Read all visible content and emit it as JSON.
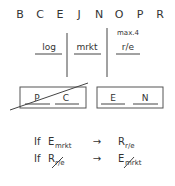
{
  "letters": [
    "B",
    "C",
    "E",
    "J",
    "N",
    "O",
    "P",
    "R"
  ],
  "columns": [
    {
      "label": "log"
    },
    {
      "label": "mrkt"
    },
    {
      "label": "r/e",
      "annotation": "max.4"
    }
  ],
  "boxes": [
    {
      "items": [
        "P",
        "C"
      ],
      "crossed_out": true
    },
    {
      "items": [
        "E",
        "N"
      ],
      "crossed_out": false
    }
  ],
  "rules": [
    {
      "keyword": "If",
      "condition": {
        "main": "E",
        "sub": "mrkt",
        "crossed": false
      },
      "arrow": "→",
      "result": {
        "main": "R",
        "sub": "r/e",
        "crossed": false
      }
    },
    {
      "keyword": "If",
      "condition": {
        "main": "R",
        "sub": "r/e",
        "crossed": true
      },
      "arrow": "→",
      "result": {
        "main": "E",
        "sub": "mrkt",
        "crossed": true
      }
    }
  ]
}
